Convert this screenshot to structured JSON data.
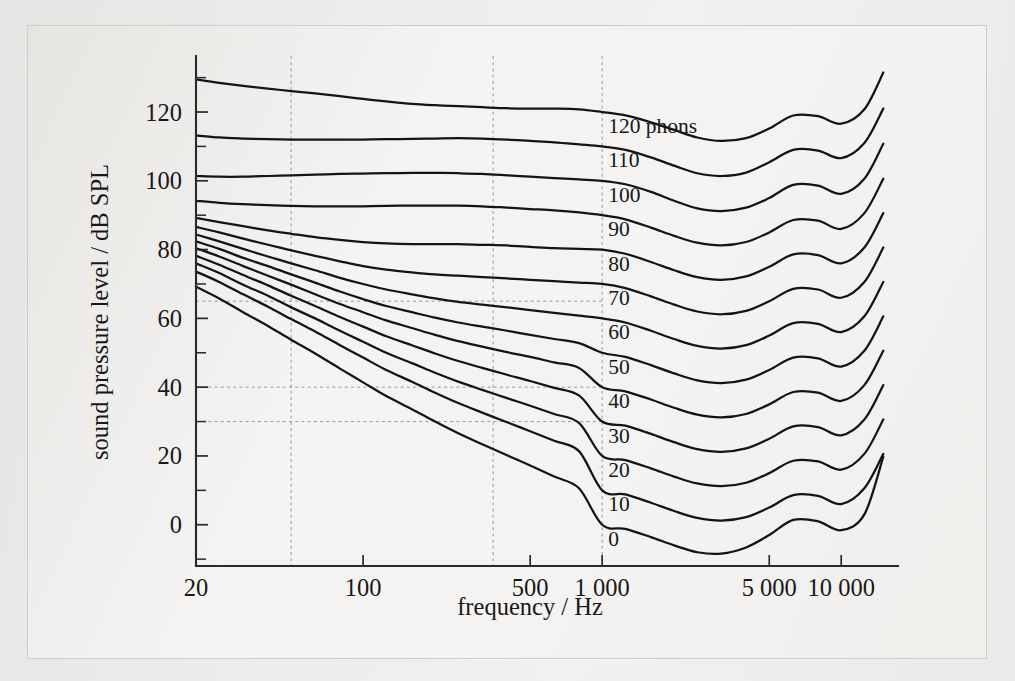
{
  "figure": {
    "background_color": "#f4f3f1",
    "line_color": "#151413",
    "grid_color": "#9a9894"
  },
  "chart_data": {
    "type": "line",
    "title": "",
    "xlabel": "frequency / Hz",
    "ylabel": "sound pressure level / dB SPL",
    "xscale": "log",
    "xlim": [
      20,
      16000
    ],
    "ylim": [
      -12,
      136
    ],
    "grid": true,
    "legend_position": "inline-labels",
    "x_tick_labels": [
      "20",
      "100",
      "500",
      "1 000",
      "5 000",
      "10 000"
    ],
    "x_tick_values": [
      20,
      100,
      500,
      1000,
      5000,
      10000
    ],
    "y_tick_labels": [
      "0",
      "20",
      "40",
      "60",
      "80",
      "100",
      "120"
    ],
    "y_tick_values": [
      0,
      20,
      40,
      60,
      80,
      100,
      120
    ],
    "y_minor_tick_values": [
      -10,
      10,
      30,
      50,
      70,
      90,
      110,
      130
    ],
    "gridlines_vertical": [
      50,
      350,
      1000
    ],
    "gridlines_horizontal": [
      65,
      40,
      30
    ],
    "x_points": [
      20,
      25,
      31.5,
      40,
      50,
      63,
      80,
      100,
      125,
      160,
      200,
      250,
      315,
      400,
      500,
      630,
      800,
      1000,
      1250,
      1600,
      2000,
      2500,
      3150,
      4000,
      5000,
      6300,
      8000,
      10000,
      12500,
      15000
    ],
    "series": [
      {
        "name": "120 phons",
        "label": "120 phons",
        "phon": 120,
        "values": [
          129.5,
          128.5,
          127.6,
          126.8,
          126.1,
          125.4,
          124.6,
          123.8,
          123.1,
          122.4,
          122.0,
          121.7,
          121.4,
          121.1,
          121.0,
          121.0,
          120.8,
          120.0,
          119.0,
          117.0,
          114.8,
          112.6,
          111.6,
          112.4,
          115.2,
          119.0,
          118.8,
          116.6,
          120.8,
          131.5
        ]
      },
      {
        "name": "110 phons",
        "label": "110",
        "phon": 110,
        "values": [
          113.2,
          112.6,
          112.3,
          112.1,
          112.0,
          112.0,
          112.0,
          112.0,
          112.1,
          112.2,
          112.3,
          112.4,
          112.3,
          112.0,
          111.6,
          111.2,
          110.6,
          110.0,
          109.0,
          106.8,
          104.4,
          102.2,
          101.4,
          102.4,
          105.4,
          109.0,
          108.8,
          106.6,
          111.0,
          121.0
        ]
      },
      {
        "name": "100 phons",
        "label": "100",
        "phon": 100,
        "values": [
          101.4,
          101.2,
          101.2,
          101.4,
          101.6,
          101.8,
          102.0,
          102.1,
          102.2,
          102.3,
          102.3,
          102.2,
          102.0,
          101.6,
          101.2,
          100.8,
          100.4,
          100.0,
          99.0,
          96.8,
          94.2,
          92.0,
          91.2,
          92.2,
          95.0,
          98.8,
          98.6,
          96.2,
          100.6,
          110.8
        ]
      },
      {
        "name": "90 phons",
        "label": "90",
        "phon": 90,
        "values": [
          94.2,
          93.6,
          93.2,
          92.9,
          92.7,
          92.6,
          92.6,
          92.6,
          92.7,
          92.8,
          92.8,
          92.8,
          92.6,
          92.2,
          91.8,
          91.4,
          90.8,
          90.0,
          88.8,
          86.4,
          84.0,
          82.0,
          81.2,
          82.2,
          85.0,
          88.6,
          88.4,
          86.0,
          90.6,
          100.6
        ]
      },
      {
        "name": "80 phons",
        "label": "80",
        "phon": 80,
        "values": [
          89.2,
          88.0,
          86.8,
          85.6,
          84.6,
          83.6,
          82.8,
          82.2,
          81.8,
          81.6,
          81.6,
          81.6,
          81.4,
          81.2,
          80.8,
          80.4,
          80.2,
          80.0,
          78.8,
          76.4,
          74.0,
          72.0,
          71.2,
          72.2,
          75.0,
          78.6,
          78.4,
          76.0,
          80.6,
          90.6
        ]
      },
      {
        "name": "70 phons",
        "label": "70",
        "phon": 70,
        "values": [
          86.6,
          85.0,
          83.2,
          81.4,
          79.8,
          78.2,
          76.6,
          75.2,
          74.2,
          73.4,
          72.8,
          72.4,
          72.0,
          71.6,
          71.2,
          70.8,
          70.4,
          70.0,
          68.8,
          66.4,
          64.0,
          62.0,
          61.2,
          62.2,
          65.0,
          68.6,
          68.4,
          66.0,
          70.6,
          80.6
        ]
      },
      {
        "name": "60 phons",
        "label": "60",
        "phon": 60,
        "values": [
          84.4,
          82.4,
          80.2,
          78.0,
          76.0,
          74.0,
          71.8,
          70.0,
          68.4,
          67.0,
          65.8,
          64.8,
          64.0,
          63.2,
          62.4,
          61.6,
          60.8,
          60.0,
          58.8,
          56.4,
          54.0,
          52.0,
          51.2,
          52.2,
          55.0,
          58.6,
          58.4,
          56.0,
          60.6,
          70.6
        ]
      },
      {
        "name": "50 phons",
        "label": "50",
        "phon": 50,
        "values": [
          82.4,
          80.2,
          77.6,
          75.2,
          72.8,
          70.4,
          67.8,
          65.6,
          63.6,
          61.8,
          60.2,
          58.8,
          57.6,
          56.4,
          55.2,
          54.0,
          52.8,
          50.0,
          48.8,
          46.4,
          44.0,
          42.0,
          41.2,
          42.2,
          45.0,
          48.6,
          48.4,
          46.0,
          50.6,
          60.6
        ]
      },
      {
        "name": "40 phons",
        "label": "40",
        "phon": 40,
        "values": [
          80.4,
          78.0,
          75.2,
          72.4,
          69.8,
          67.0,
          64.2,
          61.8,
          59.4,
          57.2,
          55.2,
          53.4,
          51.8,
          50.2,
          48.8,
          47.2,
          45.6,
          40.0,
          38.8,
          36.4,
          34.0,
          32.0,
          31.2,
          32.2,
          35.0,
          38.6,
          38.4,
          36.0,
          40.6,
          50.6
        ]
      },
      {
        "name": "30 phons",
        "label": "30",
        "phon": 30,
        "values": [
          78.2,
          75.6,
          72.6,
          69.6,
          66.6,
          63.6,
          60.4,
          57.6,
          54.8,
          52.2,
          49.8,
          47.6,
          45.6,
          43.6,
          41.8,
          39.8,
          37.6,
          30.0,
          28.8,
          26.4,
          24.0,
          22.0,
          21.2,
          22.2,
          25.0,
          28.6,
          28.4,
          26.0,
          30.6,
          40.6
        ]
      },
      {
        "name": "20 phons",
        "label": "20",
        "phon": 20,
        "values": [
          76.0,
          73.2,
          69.8,
          66.6,
          63.2,
          60.0,
          56.4,
          53.2,
          50.0,
          47.0,
          44.2,
          41.6,
          39.2,
          36.8,
          34.6,
          32.2,
          29.6,
          20.0,
          18.8,
          16.4,
          14.0,
          12.0,
          11.2,
          12.2,
          15.0,
          18.6,
          18.4,
          16.0,
          20.6,
          30.6
        ]
      },
      {
        "name": "10 phons",
        "label": "10",
        "phon": 10,
        "values": [
          73.6,
          70.6,
          67.0,
          63.4,
          59.8,
          56.2,
          52.2,
          48.6,
          45.0,
          41.6,
          38.4,
          35.4,
          32.6,
          29.8,
          27.2,
          24.4,
          21.4,
          10.0,
          8.8,
          6.4,
          4.0,
          2.0,
          1.2,
          2.2,
          5.0,
          8.6,
          8.4,
          6.0,
          10.6,
          20.6
        ]
      },
      {
        "name": "0 phons",
        "label": "0",
        "phon": 0,
        "values": [
          69.2,
          65.8,
          61.8,
          57.8,
          53.8,
          49.8,
          45.4,
          41.4,
          37.4,
          33.6,
          30.0,
          26.6,
          23.4,
          20.2,
          17.2,
          14.0,
          10.6,
          0.0,
          -1.2,
          -3.6,
          -6.0,
          -8.0,
          -8.4,
          -6.6,
          -3.0,
          1.4,
          1.0,
          -1.6,
          3.0,
          19.8
        ]
      }
    ]
  },
  "axes": {
    "x_title": "frequency / Hz",
    "y_title": "sound pressure level / dB SPL"
  }
}
